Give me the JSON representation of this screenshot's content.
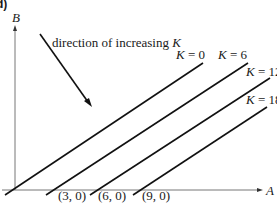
{
  "panel_label": "d)",
  "axes": {
    "y_label": "B",
    "x_label": "A"
  },
  "annotation": {
    "text_prefix": "direction of increasing ",
    "text_var": "K"
  },
  "iso_lines": [
    {
      "label": "K = 0",
      "var": "K",
      "value": "0"
    },
    {
      "label": "K = 6",
      "var": "K",
      "value": "6"
    },
    {
      "label": "K = 12",
      "var": "K",
      "value": "12"
    },
    {
      "label": "K = 18",
      "var": "K",
      "value": "18"
    }
  ],
  "intercepts": [
    {
      "label": "(3, 0)"
    },
    {
      "label": "(6, 0)"
    },
    {
      "label": "(9, 0)"
    }
  ]
}
